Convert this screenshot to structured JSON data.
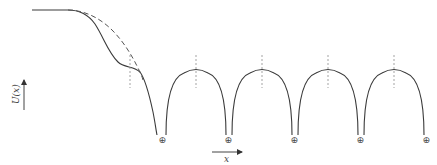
{
  "figure": {
    "y_axis_label": "U(x)",
    "x_axis_label": "x",
    "ion_symbol": "⊕",
    "ion_count": 5,
    "arch_count": 4,
    "curves": {
      "solid": "potential energy with image-force shoulder near surface",
      "dashed": "potential energy without shoulder"
    }
  }
}
